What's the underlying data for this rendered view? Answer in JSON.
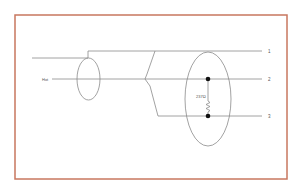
{
  "diagram": {
    "frame_color": "#c8775f",
    "line_color": "#8a8a8a",
    "dot_color": "#111111",
    "labels": {
      "hot": "Hot",
      "terminal_1": "1",
      "terminal_2": "2",
      "terminal_3": "3",
      "resistance": "237Ω"
    }
  }
}
